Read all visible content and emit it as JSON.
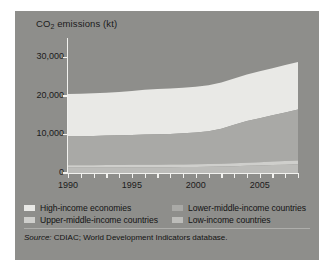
{
  "figure": {
    "panel_color": "#8e8e8b",
    "axis_color": "#f2f2ef",
    "text_color": "#1b1b1b"
  },
  "title": {
    "pre": "CO",
    "sub": "2",
    "post": " emissions (kt)"
  },
  "legend": {
    "rows": [
      [
        {
          "label": "High-income economies",
          "color": "#e9e9e6"
        },
        {
          "label": "Lower-middle-income countries",
          "color": "#a9a9a6"
        }
      ],
      [
        {
          "label": "Upper-middle-income countries",
          "color": "#cfcfcc"
        },
        {
          "label": "Low-income countries",
          "color": "#bcbcb9"
        }
      ]
    ]
  },
  "source": {
    "lead": "Source:",
    "text": " CDIAC; World Development Indicators database."
  },
  "chart_data": {
    "type": "area",
    "stacked": true,
    "title": "CO2 emissions (kt)",
    "xlabel": "",
    "ylabel": "CO2 emissions (kt)",
    "xlim": [
      1990,
      2008
    ],
    "ylim": [
      0,
      35000
    ],
    "yticks": [
      0,
      10000,
      20000,
      30000
    ],
    "ytick_labels": [
      "0",
      "10,000",
      "20,000",
      "30,000"
    ],
    "xticks": [
      1990,
      1995,
      2000,
      2005
    ],
    "xtick_labels": [
      "1990",
      "1995",
      "2000",
      "2005"
    ],
    "minor_xticks": [
      1990,
      1991,
      1992,
      1993,
      1994,
      1995,
      1996,
      1997,
      1998,
      1999,
      2000,
      2001,
      2002,
      2003,
      2004,
      2005,
      2006,
      2007,
      2008
    ],
    "grid": false,
    "legend_position": "below",
    "x": [
      1990,
      1991,
      1992,
      1993,
      1994,
      1995,
      1996,
      1997,
      1998,
      1999,
      2000,
      2001,
      2002,
      2003,
      2004,
      2005,
      2006,
      2007,
      2008
    ],
    "series": [
      {
        "name": "Low-income countries",
        "color": "#bcbcb9",
        "values": [
          1400,
          1400,
          1400,
          1420,
          1440,
          1460,
          1480,
          1500,
          1520,
          1550,
          1580,
          1620,
          1680,
          1760,
          1850,
          1950,
          2050,
          2150,
          2250
        ]
      },
      {
        "name": "Upper-middle-income countries",
        "color": "#cfcfcc",
        "values": [
          600,
          610,
          620,
          630,
          640,
          650,
          660,
          665,
          670,
          680,
          690,
          700,
          720,
          760,
          800,
          850,
          900,
          950,
          1000
        ]
      },
      {
        "name": "Lower-middle-income countries",
        "color": "#a9a9a6",
        "values": [
          7500,
          7550,
          7600,
          7650,
          7700,
          7750,
          7850,
          7900,
          7950,
          8050,
          8200,
          8500,
          9100,
          10000,
          10800,
          11400,
          12000,
          12600,
          13200
        ]
      },
      {
        "name": "High-income economies",
        "color": "#e9e9e6",
        "values": [
          11000,
          11000,
          11050,
          11100,
          11250,
          11400,
          11600,
          11700,
          11750,
          11800,
          11900,
          11950,
          11950,
          12000,
          12100,
          12150,
          12200,
          12300,
          12350
        ]
      }
    ],
    "stack_tops": {
      "low_income": [
        1400,
        1400,
        1400,
        1420,
        1440,
        1460,
        1480,
        1500,
        1520,
        1550,
        1580,
        1620,
        1680,
        1760,
        1850,
        1950,
        2050,
        2150,
        2250
      ],
      "upper_middle": [
        2000,
        2010,
        2020,
        2050,
        2080,
        2110,
        2140,
        2165,
        2190,
        2230,
        2270,
        2320,
        2400,
        2520,
        2650,
        2800,
        2950,
        3100,
        3250
      ],
      "lower_middle": [
        9500,
        9560,
        9620,
        9700,
        9780,
        9860,
        9990,
        10065,
        10140,
        10280,
        10470,
        10820,
        11500,
        12520,
        13450,
        14200,
        14950,
        15700,
        16450
      ],
      "total": [
        20500,
        20560,
        20670,
        20800,
        21030,
        21260,
        21590,
        21765,
        21890,
        22080,
        22370,
        22770,
        23450,
        24520,
        25550,
        26350,
        27150,
        28000,
        28800
      ]
    }
  }
}
